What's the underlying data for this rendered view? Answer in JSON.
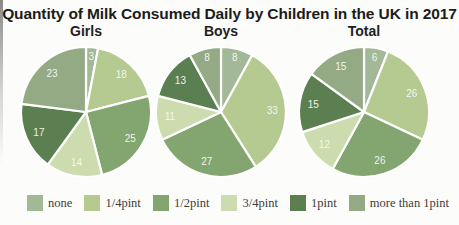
{
  "page": {
    "title": "Quantity of Milk Consumed Daily by Children in the UK in 2017"
  },
  "legend": {
    "items": [
      {
        "label": "none",
        "color": "#a2b896"
      },
      {
        "label": "1/4pint",
        "color": "#b4ca90"
      },
      {
        "label": "1/2pint",
        "color": "#83a56f"
      },
      {
        "label": "3/4pint",
        "color": "#ccdcae"
      },
      {
        "label": "1pint",
        "color": "#5c7f52"
      },
      {
        "label": "more than 1pint",
        "color": "#93aa85"
      }
    ]
  },
  "chart_data": [
    {
      "type": "pie",
      "title": "Girls",
      "categories": [
        "none",
        "1/4pint",
        "1/2pint",
        "3/4pint",
        "1pint",
        "more than 1pint"
      ],
      "values": [
        3,
        18,
        25,
        14,
        17,
        23
      ],
      "colors": [
        "#a2b896",
        "#b4ca90",
        "#83a56f",
        "#ccdcae",
        "#5c7f52",
        "#93aa85"
      ],
      "unit": "percent",
      "start_angle": "12 o'clock",
      "direction": "clockwise",
      "label_color": "#ffffff"
    },
    {
      "type": "pie",
      "title": "Boys",
      "categories": [
        "none",
        "1/4pint",
        "1/2pint",
        "3/4pint",
        "1pint",
        "more than 1pint"
      ],
      "values": [
        8,
        33,
        27,
        11,
        13,
        8
      ],
      "colors": [
        "#a2b896",
        "#b4ca90",
        "#83a56f",
        "#ccdcae",
        "#5c7f52",
        "#93aa85"
      ],
      "unit": "percent",
      "start_angle": "12 o'clock",
      "direction": "clockwise",
      "label_color": "#ffffff"
    },
    {
      "type": "pie",
      "title": "Total",
      "categories": [
        "none",
        "1/4pint",
        "1/2pint",
        "3/4pint",
        "1pint",
        "more than 1pint"
      ],
      "values": [
        6,
        26,
        26,
        12,
        15,
        15
      ],
      "colors": [
        "#a2b896",
        "#b4ca90",
        "#83a56f",
        "#ccdcae",
        "#5c7f52",
        "#93aa85"
      ],
      "unit": "percent",
      "start_angle": "12 o'clock",
      "direction": "clockwise",
      "label_color": "#ffffff"
    }
  ]
}
